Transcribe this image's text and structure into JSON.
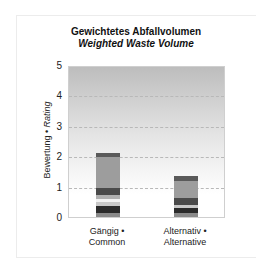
{
  "chart_data": {
    "type": "bar",
    "stacked": true,
    "title": "Gewichtetes Abfallvolumen",
    "subtitle": "Weighted Waste Volume",
    "xlabel": "",
    "ylabel": "Bewertung • Rating",
    "ylabel_de": "Bewertung",
    "ylabel_en": "Rating",
    "ylim": [
      0,
      5
    ],
    "yticks": [
      0,
      1,
      2,
      3,
      4,
      5
    ],
    "grid": true,
    "legend": "none",
    "categories": [
      "Gängig • Common",
      "Alternativ • Alternative"
    ],
    "category_lines": [
      [
        "Gängig •",
        "Common"
      ],
      [
        "Alternativ •",
        "Alternative"
      ]
    ],
    "totals": [
      2.12,
      1.35
    ],
    "series": [
      {
        "name": "segment-1",
        "color": "#8a8a8a",
        "values": [
          0.12,
          0.12
        ]
      },
      {
        "name": "segment-2",
        "color": "#2b2b2b",
        "values": [
          0.23,
          0.17
        ]
      },
      {
        "name": "segment-3",
        "color": "#c8c8c8",
        "values": [
          0.13,
          0.1
        ]
      },
      {
        "name": "segment-4",
        "color": "#f2f2f2",
        "values": [
          0.13,
          0.0
        ]
      },
      {
        "name": "segment-5",
        "color": "#b0b0b0",
        "values": [
          0.13,
          0.0
        ]
      },
      {
        "name": "segment-6",
        "color": "#4a4a4a",
        "values": [
          0.23,
          0.23
        ]
      },
      {
        "name": "segment-7",
        "color": "#9d9d9d",
        "values": [
          0.99,
          0.56
        ]
      },
      {
        "name": "segment-8",
        "color": "#5a5a5a",
        "values": [
          0.16,
          0.17
        ]
      }
    ]
  }
}
